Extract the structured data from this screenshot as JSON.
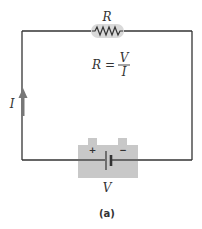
{
  "diagram": {
    "type": "circuit",
    "resistor": {
      "label": "R"
    },
    "equation": {
      "lhs": "R =",
      "numerator": "V",
      "denominator": "I"
    },
    "current": {
      "label": "I",
      "direction": "up"
    },
    "battery": {
      "label": "V",
      "positive": "+",
      "negative": "−"
    },
    "caption": "(a)",
    "colors": {
      "wire": "#333333",
      "component_fill": "#c8c8c8",
      "highlight": "#d9d9d9",
      "arrow": "#777777",
      "text": "#333333"
    }
  }
}
